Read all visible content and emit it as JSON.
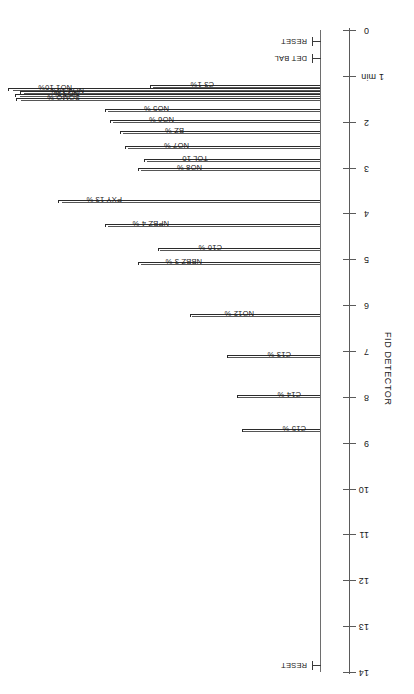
{
  "chart_data": {
    "type": "line",
    "title": "FID DETECTOR",
    "xlabel": "",
    "ylabel": "",
    "orientation": "rotated-180",
    "axis": {
      "name": "time-axis",
      "unit": "min",
      "range": [
        0,
        14
      ],
      "tick_values": [
        0,
        1,
        2,
        3,
        4,
        5,
        6,
        7,
        8,
        9,
        10,
        11,
        12,
        13,
        14
      ],
      "tick_labels": [
        "0",
        "1 min",
        "2",
        "3",
        "4",
        "5",
        "6",
        "7",
        "8",
        "9",
        "10",
        "11",
        "12",
        "13",
        "14"
      ],
      "grid": false
    },
    "events": [
      {
        "label": "RESET",
        "time": 0.25
      },
      {
        "label": "DET BAL",
        "time": 0.62
      },
      {
        "label": "RESET",
        "time": 13.85
      }
    ],
    "peaks": [
      {
        "label": "C3 1%",
        "time": 1.2,
        "amount_pct": 1,
        "length": 170
      },
      {
        "label": "NO1 10%",
        "time": 1.27,
        "amount_pct": 10,
        "length": 312
      },
      {
        "label": "NO4 10%",
        "time": 1.33,
        "amount_pct": 10,
        "length": 300
      },
      {
        "label": "NO3 %",
        "time": 1.4,
        "amount_pct": 0,
        "length": 305
      },
      {
        "label": "SOMO %",
        "time": 1.48,
        "amount_pct": 0,
        "length": 304
      },
      {
        "label": "NO5 %",
        "time": 1.72,
        "amount_pct": 0,
        "length": 215
      },
      {
        "label": "NO6 %",
        "time": 1.96,
        "amount_pct": 0,
        "length": 210
      },
      {
        "label": "BZ %",
        "time": 2.2,
        "amount_pct": 0,
        "length": 200
      },
      {
        "label": "NO7 %",
        "time": 2.52,
        "amount_pct": 0,
        "length": 195
      },
      {
        "label": "TOL 10",
        "time": 2.82,
        "amount_pct": 10,
        "length": 176
      },
      {
        "label": "NO8 %",
        "time": 3.02,
        "amount_pct": 0,
        "length": 182
      },
      {
        "label": "PXY 13 %",
        "time": 3.7,
        "amount_pct": 13,
        "length": 262
      },
      {
        "label": "NPBZ 4 %",
        "time": 4.22,
        "amount_pct": 4,
        "length": 215
      },
      {
        "label": "C10 %",
        "time": 4.75,
        "amount_pct": 0,
        "length": 162
      },
      {
        "label": "NBBZ 3 %",
        "time": 5.05,
        "amount_pct": 3,
        "length": 182
      },
      {
        "label": "NO12 %",
        "time": 6.2,
        "amount_pct": 0,
        "length": 130
      },
      {
        "label": "C13 %",
        "time": 7.08,
        "amount_pct": 0,
        "length": 93
      },
      {
        "label": "C14 %",
        "time": 7.95,
        "amount_pct": 0,
        "length": 83
      },
      {
        "label": "C15 %",
        "time": 8.7,
        "amount_pct": 0,
        "length": 78
      }
    ]
  }
}
